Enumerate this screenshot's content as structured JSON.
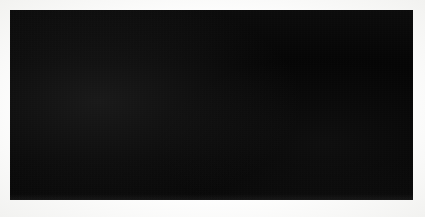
{
  "plate": {
    "kind": "photographic-oscillograph-plate",
    "width": 425,
    "height": 217,
    "paper_color": "#fbfbfa",
    "field_color": "#050505",
    "trace_color": "#d8d8d4",
    "field": {
      "left": 10,
      "top": 10,
      "width": 403,
      "height": 190
    }
  },
  "labels": [
    {
      "id": "A",
      "text": "A",
      "x": 28,
      "y": 55,
      "describes": "leading crest of the broad striated trace band"
    },
    {
      "id": "B",
      "text": "B",
      "x": 214,
      "y": 94,
      "describes": "trailing taper of the striated trace band"
    },
    {
      "id": "C",
      "text": "C",
      "x": 393,
      "y": 123,
      "describes": "lower shallow diagonal trace in the right panel"
    }
  ],
  "features": {
    "striated_band": {
      "name": "striated-waveform-band",
      "striation_count": 58,
      "brightness_range": [
        0.35,
        1.0
      ],
      "upper_edge_points": [
        [
          6,
          178
        ],
        [
          8,
          150
        ],
        [
          11,
          120
        ],
        [
          15,
          94
        ],
        [
          20,
          78
        ],
        [
          28,
          68
        ],
        [
          40,
          62
        ],
        [
          55,
          59
        ],
        [
          72,
          58
        ],
        [
          92,
          59
        ],
        [
          112,
          62
        ],
        [
          132,
          66
        ],
        [
          152,
          71
        ],
        [
          170,
          76
        ],
        [
          188,
          80
        ],
        [
          206,
          80
        ],
        [
          224,
          77
        ],
        [
          242,
          72
        ],
        [
          258,
          69
        ],
        [
          272,
          68
        ],
        [
          284,
          68
        ],
        [
          292,
          68
        ]
      ],
      "lower_edge_points": [
        [
          6,
          182
        ],
        [
          10,
          168
        ],
        [
          16,
          152
        ],
        [
          24,
          144
        ],
        [
          36,
          142
        ],
        [
          52,
          143
        ],
        [
          70,
          146
        ],
        [
          90,
          150
        ],
        [
          110,
          155
        ],
        [
          130,
          159
        ],
        [
          150,
          161
        ],
        [
          170,
          160
        ],
        [
          190,
          155
        ],
        [
          208,
          146
        ],
        [
          226,
          134
        ],
        [
          244,
          120
        ],
        [
          258,
          108
        ],
        [
          270,
          98
        ],
        [
          280,
          90
        ],
        [
          288,
          82
        ],
        [
          292,
          75
        ]
      ]
    },
    "vertical_rules": [
      {
        "name": "panel-divider-1",
        "x": 277,
        "y_top": 2,
        "y_bottom": 188,
        "color": "#e9e9e6",
        "width": 1.3
      },
      {
        "name": "panel-divider-2",
        "x": 328,
        "y_top": 2,
        "y_bottom": 188,
        "color": "#e9e9e6",
        "width": 1.3
      }
    ],
    "diagonal_traces": [
      {
        "name": "trace-segment-middle",
        "x1": 277,
        "y1": 83,
        "x2": 328,
        "y2": 95,
        "color": "#e4e4e0",
        "width": 1.4
      },
      {
        "name": "trace-segment-C",
        "x1": 328,
        "y1": 116,
        "x2": 403,
        "y2": 123,
        "color": "#dcdcd8",
        "width": 1.2
      }
    ]
  }
}
